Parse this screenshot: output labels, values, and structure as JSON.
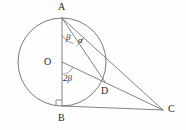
{
  "figure": {
    "name": "circle-tangent-geometry",
    "background_color": "#fefefe",
    "stroke_color": "#6e6e6e",
    "label_color": "#1e1e1e",
    "width": 186,
    "height": 130
  },
  "points": [
    {
      "id": "A",
      "label": "A",
      "x": 62,
      "y": 18,
      "label_x": 58,
      "label_y": 2
    },
    {
      "id": "O",
      "label": "O",
      "x": 62,
      "y": 62,
      "label_x": 44,
      "label_y": 57
    },
    {
      "id": "B",
      "label": "B",
      "x": 62,
      "y": 106,
      "label_x": 58,
      "label_y": 113
    },
    {
      "id": "D",
      "label": "D",
      "x": 105,
      "y": 82,
      "label_x": 101,
      "label_y": 86
    },
    {
      "id": "C",
      "label": "C",
      "x": 163,
      "y": 110,
      "label_x": 168,
      "label_y": 104
    }
  ],
  "circle": {
    "center_x": 62,
    "center_y": 62,
    "radius": 44,
    "name": "main-circle"
  },
  "segments": [
    {
      "id": "AB",
      "name": "segment-ab",
      "from": "A",
      "to": "B",
      "description": "vertical diameter"
    },
    {
      "id": "AD",
      "name": "segment-ad",
      "from": "A",
      "to": "D",
      "description": "chord to D"
    },
    {
      "id": "AC",
      "name": "segment-ac",
      "from": "A",
      "to": "C",
      "description": "line to external point C"
    },
    {
      "id": "OC",
      "name": "segment-oc",
      "from": "O",
      "to": "C",
      "description": "radius extended through D to C"
    },
    {
      "id": "BC",
      "name": "segment-bc",
      "from": "B",
      "to": "C",
      "description": "horizontal tangent at B"
    }
  ],
  "angles": [
    {
      "id": "beta_at_A",
      "name": "angle-beta-at-a",
      "label": "β",
      "vertex": "A",
      "between": [
        "AB",
        "AD"
      ],
      "label_x": 66,
      "label_y": 33
    },
    {
      "id": "alpha_at_A",
      "name": "angle-alpha-at-a",
      "label": "α",
      "vertex": "A",
      "between": [
        "AD",
        "AC"
      ],
      "label_x": 78,
      "label_y": 36
    },
    {
      "id": "two_beta_at_O",
      "name": "angle-two-beta-at-o",
      "label": "2β",
      "vertex": "O",
      "between": [
        "OB",
        "OD"
      ],
      "label_x": 63,
      "label_y": 74
    }
  ],
  "markers": [
    {
      "id": "right_angle_B",
      "name": "right-angle-mark-at-b",
      "vertex": "B",
      "label": "90°",
      "x": 62,
      "y": 106,
      "size": 6
    }
  ]
}
